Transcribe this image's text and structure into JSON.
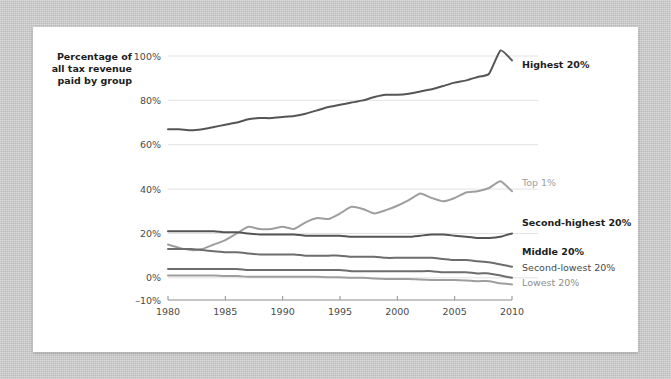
{
  "figure": {
    "axis_title_lines": [
      "Percentage of",
      "all tax revenue",
      "paid by group"
    ],
    "background_color": "#ffffff",
    "page_background_color": "#c9c9c9"
  },
  "chart_data": {
    "type": "line",
    "title": "",
    "subtitle": "",
    "xlabel": "",
    "ylabel": "Percentage of all tax revenue paid by group",
    "xlim": [
      1980,
      2010
    ],
    "ylim": [
      -10,
      100
    ],
    "xticks": [
      1980,
      1985,
      1990,
      1995,
      2000,
      2005,
      2010
    ],
    "xtick_labels": [
      "1980",
      "1985",
      "1990",
      "1995",
      "2000",
      "2005",
      "2010"
    ],
    "yticks": [
      -10,
      0,
      20,
      40,
      60,
      80,
      100
    ],
    "ytick_labels": [
      "–10%",
      "0%",
      "20%",
      "40%",
      "60%",
      "80%",
      "100%"
    ],
    "grid": true,
    "grid_axis": "y",
    "legend_position": "right-inline",
    "x": [
      1980,
      1981,
      1982,
      1983,
      1984,
      1985,
      1986,
      1987,
      1988,
      1989,
      1990,
      1991,
      1992,
      1993,
      1994,
      1995,
      1996,
      1997,
      1998,
      1999,
      2000,
      2001,
      2002,
      2003,
      2004,
      2005,
      2006,
      2007,
      2008,
      2009,
      2010
    ],
    "series": [
      {
        "name": "Highest 20%",
        "label": "Highest 20%",
        "color": "#555555",
        "width": 2.0,
        "label_style": "bold",
        "values": [
          67,
          67,
          66.5,
          67,
          68,
          69,
          70,
          71.5,
          72,
          72,
          72.5,
          73,
          74,
          75.5,
          77,
          78,
          79,
          80,
          81.5,
          82.5,
          82.5,
          83,
          84,
          85,
          86.5,
          88,
          89,
          90.5,
          92,
          102.5,
          98
        ]
      },
      {
        "name": "Top 1%",
        "label": "Top 1%",
        "color": "#9e9e9e",
        "width": 2.0,
        "label_style": "normal",
        "values": [
          15,
          13.5,
          12.5,
          13,
          15,
          17,
          20,
          23,
          22,
          22,
          23,
          22,
          25,
          27,
          26.5,
          29,
          32,
          31,
          29,
          30.5,
          32.5,
          35,
          38,
          36,
          34.5,
          36,
          38.5,
          39,
          40.5,
          43.5,
          39
        ]
      },
      {
        "name": "Second-highest 20%",
        "label": "Second-highest 20%",
        "color": "#555555",
        "width": 2.0,
        "label_style": "bold",
        "values": [
          21,
          21,
          21,
          21,
          21,
          20.5,
          20.5,
          20,
          19.5,
          19.5,
          19.5,
          19.5,
          19,
          19,
          19,
          19,
          18.5,
          18.5,
          18.5,
          18.5,
          18.5,
          18.5,
          19,
          19.5,
          19.5,
          19,
          18.5,
          18,
          18,
          18.5,
          20
        ]
      },
      {
        "name": "Middle 20%",
        "label": "Middle 20%",
        "color": "#6d6d6d",
        "width": 2.0,
        "label_style": "bold",
        "values": [
          13,
          13,
          13,
          12.5,
          12,
          11.5,
          11.5,
          11,
          10.5,
          10.5,
          10.5,
          10.5,
          10,
          10,
          10,
          10,
          9.5,
          9.5,
          9.5,
          9,
          9,
          9,
          9,
          9,
          8.5,
          8,
          8,
          7.5,
          7,
          6,
          5
        ]
      },
      {
        "name": "Second-lowest 20%",
        "label": "Second-lowest 20%",
        "color": "#6d6d6d",
        "width": 2.0,
        "label_style": "normal",
        "values": [
          4,
          4,
          4,
          4,
          4,
          4,
          4,
          3.5,
          3.5,
          3.5,
          3.5,
          3.5,
          3.5,
          3.5,
          3.5,
          3.5,
          3,
          3,
          3,
          3,
          3,
          3,
          3,
          3,
          2.5,
          2.5,
          2.5,
          2,
          2,
          1,
          0
        ]
      },
      {
        "name": "Lowest 20%",
        "label": "Lowest 20%",
        "color": "#9e9e9e",
        "width": 2.0,
        "label_style": "muted",
        "values": [
          1,
          1,
          1,
          1,
          1,
          0.8,
          0.8,
          0.5,
          0.5,
          0.5,
          0.5,
          0.5,
          0.5,
          0.5,
          0.3,
          0.3,
          0,
          0,
          -0.3,
          -0.5,
          -0.5,
          -0.5,
          -0.8,
          -1,
          -1,
          -1,
          -1.2,
          -1.5,
          -1.5,
          -2.5,
          -3
        ]
      }
    ],
    "annotations": []
  }
}
